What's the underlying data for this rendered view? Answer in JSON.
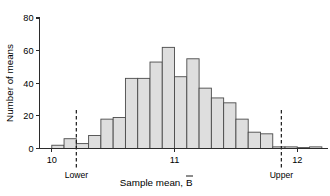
{
  "chart_data": {
    "type": "bar",
    "title": "",
    "subtitle": "",
    "xlabel": "Sample mean, B̄",
    "xlabel_text": "Sample mean,",
    "xlabel_symbol": "B",
    "ylabel": "Number of means",
    "xlim": [
      9.9,
      12.25
    ],
    "ylim": [
      0,
      80
    ],
    "grid": false,
    "legend": null,
    "bin_width": 0.1,
    "categories": [
      "10.0-10.1",
      "10.1-10.2",
      "10.2-10.3",
      "10.3-10.4",
      "10.4-10.5",
      "10.5-10.6",
      "10.6-10.7",
      "10.7-10.8",
      "10.8-10.9",
      "10.9-11.0",
      "11.0-11.1",
      "11.1-11.2",
      "11.2-11.3",
      "11.3-11.4",
      "11.4-11.5",
      "11.5-11.6",
      "11.6-11.7",
      "11.7-11.8",
      "11.8-11.9",
      "11.9-12.0",
      "12.0-12.1",
      "12.1-12.2"
    ],
    "bin_edges": [
      10.0,
      10.1,
      10.2,
      10.3,
      10.4,
      10.5,
      10.6,
      10.7,
      10.8,
      10.9,
      11.0,
      11.1,
      11.2,
      11.3,
      11.4,
      11.5,
      11.6,
      11.7,
      11.8,
      11.9,
      12.0,
      12.1,
      12.2
    ],
    "values": [
      2,
      6,
      3,
      8,
      18,
      19,
      43,
      43,
      53,
      62,
      44,
      55,
      37,
      31,
      28,
      18,
      10,
      9,
      1,
      1,
      0,
      1
    ],
    "xticks": [
      10,
      11,
      12
    ],
    "xtick_labels": [
      "10",
      "11",
      "12"
    ],
    "yticks": [
      0,
      20,
      40,
      60,
      80
    ],
    "ytick_labels": [
      "0",
      "20",
      "40",
      "60",
      "80"
    ],
    "annotations": [
      {
        "name": "lower-limit",
        "label": "Lower",
        "x": 10.2,
        "style": "dashed-vertical"
      },
      {
        "name": "upper-limit",
        "label": "Upper",
        "x": 11.87,
        "style": "dashed-vertical"
      }
    ],
    "colors": {
      "bar_fill": "#dedede",
      "bar_stroke": "#4a4a4a",
      "axis": "#2b2b2b",
      "reference_line": "#1a1a1a",
      "background": "#ffffff"
    }
  }
}
